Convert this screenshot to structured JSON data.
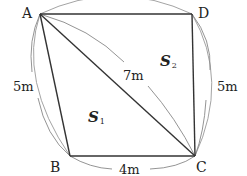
{
  "figure": {
    "type": "cyclic-quadrilateral",
    "vertices": {
      "A": {
        "label": "A",
        "x": 40,
        "y": 14
      },
      "B": {
        "label": "B",
        "x": 70,
        "y": 156
      },
      "C": {
        "label": "C",
        "x": 195,
        "y": 156
      },
      "D": {
        "label": "D",
        "x": 192,
        "y": 14
      }
    },
    "measurements": {
      "AB": "5m",
      "BC": "4m",
      "CD": "5m",
      "AC": "7m"
    },
    "regions": {
      "S1": {
        "symbol": "S",
        "subscript": "1"
      },
      "S2": {
        "symbol": "S",
        "subscript": "2"
      }
    },
    "colors": {
      "edge": "#333333",
      "arc": "#888888",
      "text": "#222222"
    }
  }
}
